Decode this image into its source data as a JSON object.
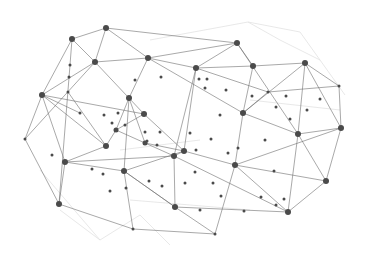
{
  "graphic": {
    "title": "",
    "description": "Abstract network mesh of connected nodes",
    "background": "#ffffff",
    "edge_color": "#6e6e6e",
    "faint_edge_color": "#e2e2e2",
    "node_color": "#4a4a4a",
    "nodes": [
      [
        106,
        28,
        3
      ],
      [
        72,
        39,
        3
      ],
      [
        95,
        62,
        3
      ],
      [
        148,
        58,
        3
      ],
      [
        237,
        43,
        3
      ],
      [
        196,
        68,
        3
      ],
      [
        253,
        66,
        3
      ],
      [
        305,
        63,
        3
      ],
      [
        42,
        95,
        3
      ],
      [
        129,
        98,
        3
      ],
      [
        144,
        114,
        3
      ],
      [
        116,
        130,
        2.5
      ],
      [
        106,
        146,
        3
      ],
      [
        243,
        113,
        3
      ],
      [
        298,
        134,
        3
      ],
      [
        341,
        128,
        3
      ],
      [
        268,
        92,
        1.5
      ],
      [
        339,
        86,
        1.5
      ],
      [
        65,
        162,
        3
      ],
      [
        174,
        156,
        3
      ],
      [
        184,
        151,
        3
      ],
      [
        235,
        165,
        3
      ],
      [
        124,
        171,
        3
      ],
      [
        145,
        143,
        2.5
      ],
      [
        59,
        204,
        3
      ],
      [
        326,
        181,
        3
      ],
      [
        288,
        212,
        3
      ],
      [
        175,
        207,
        3
      ],
      [
        133,
        229,
        1.5
      ],
      [
        215,
        234,
        1.5
      ],
      [
        25,
        139,
        1.5
      ],
      [
        70,
        65,
        1.5
      ],
      [
        69,
        77,
        1.5
      ],
      [
        68,
        92,
        1.5
      ],
      [
        80,
        113,
        1.5
      ],
      [
        135,
        80,
        1.5
      ],
      [
        161,
        77,
        1.5
      ],
      [
        199,
        79,
        1.5
      ],
      [
        207,
        79,
        1.5
      ],
      [
        205,
        88,
        1.5
      ],
      [
        226,
        90,
        1.5
      ],
      [
        252,
        96,
        1.5
      ],
      [
        286,
        96,
        1.5
      ],
      [
        276,
        107,
        1.5
      ],
      [
        307,
        110,
        1.5
      ],
      [
        320,
        99,
        1.5
      ],
      [
        290,
        119,
        1.5
      ],
      [
        112,
        123,
        1.5
      ],
      [
        125,
        125,
        1.5
      ],
      [
        145,
        132,
        1.5
      ],
      [
        160,
        132,
        1.5
      ],
      [
        147,
        141,
        1.5
      ],
      [
        157,
        145,
        1.5
      ],
      [
        190,
        133,
        1.5
      ],
      [
        211,
        139,
        1.5
      ],
      [
        220,
        115,
        1.5
      ],
      [
        228,
        153,
        1.5
      ],
      [
        265,
        140,
        1.5
      ],
      [
        274,
        171,
        1.5
      ],
      [
        196,
        150,
        1.5
      ],
      [
        238,
        148,
        1.5
      ],
      [
        162,
        186,
        1.5
      ],
      [
        185,
        183,
        1.5
      ],
      [
        195,
        172,
        1.5
      ],
      [
        221,
        196,
        1.5
      ],
      [
        213,
        183,
        1.5
      ],
      [
        110,
        191,
        1.5
      ],
      [
        103,
        174,
        1.5
      ],
      [
        126,
        188,
        1.5
      ],
      [
        149,
        181,
        1.5
      ],
      [
        261,
        197,
        1.5
      ],
      [
        276,
        205,
        1.5
      ],
      [
        284,
        199,
        1.5
      ],
      [
        244,
        211,
        1.5
      ],
      [
        200,
        210,
        1.5
      ],
      [
        52,
        155,
        1.5
      ],
      [
        92,
        169,
        1.5
      ],
      [
        118,
        113,
        1.5
      ],
      [
        104,
        115,
        1.5
      ]
    ],
    "edges": [
      [
        0,
        1
      ],
      [
        0,
        2
      ],
      [
        0,
        3
      ],
      [
        0,
        4
      ],
      [
        1,
        2
      ],
      [
        1,
        8
      ],
      [
        1,
        31
      ],
      [
        2,
        8
      ],
      [
        2,
        10
      ],
      [
        2,
        30
      ],
      [
        3,
        5
      ],
      [
        3,
        13
      ],
      [
        3,
        9
      ],
      [
        3,
        2
      ],
      [
        4,
        5
      ],
      [
        4,
        6
      ],
      [
        4,
        14
      ],
      [
        4,
        3
      ],
      [
        5,
        6
      ],
      [
        5,
        19
      ],
      [
        5,
        20
      ],
      [
        6,
        7
      ],
      [
        6,
        13
      ],
      [
        7,
        15
      ],
      [
        7,
        13
      ],
      [
        7,
        14
      ],
      [
        7,
        17
      ],
      [
        8,
        12
      ],
      [
        8,
        10
      ],
      [
        8,
        18
      ],
      [
        9,
        11
      ],
      [
        9,
        22
      ],
      [
        10,
        20
      ],
      [
        10,
        11
      ],
      [
        11,
        12
      ],
      [
        11,
        19
      ],
      [
        12,
        18
      ],
      [
        13,
        14
      ],
      [
        13,
        21
      ],
      [
        14,
        15
      ],
      [
        14,
        25
      ],
      [
        14,
        26
      ],
      [
        15,
        25
      ],
      [
        16,
        13
      ],
      [
        16,
        17
      ],
      [
        17,
        15
      ],
      [
        18,
        22
      ],
      [
        18,
        24
      ],
      [
        19,
        20
      ],
      [
        19,
        27
      ],
      [
        19,
        26
      ],
      [
        20,
        21
      ],
      [
        20,
        22
      ],
      [
        21,
        26
      ],
      [
        21,
        15
      ],
      [
        22,
        27
      ],
      [
        22,
        28
      ],
      [
        23,
        9
      ],
      [
        23,
        20
      ],
      [
        24,
        28
      ],
      [
        25,
        26
      ],
      [
        26,
        27
      ],
      [
        27,
        29
      ],
      [
        28,
        29
      ],
      [
        29,
        21
      ],
      [
        30,
        8
      ],
      [
        30,
        24
      ],
      [
        12,
        33
      ],
      [
        8,
        34
      ],
      [
        22,
        27
      ],
      [
        5,
        16
      ],
      [
        21,
        25
      ],
      [
        18,
        19
      ],
      [
        24,
        31
      ]
    ],
    "faint_edges": [
      [
        248,
        22,
        280,
        40
      ],
      [
        248,
        22,
        300,
        32
      ],
      [
        280,
        40,
        320,
        60
      ],
      [
        300,
        32,
        345,
        95
      ],
      [
        150,
        40,
        248,
        22
      ],
      [
        60,
        210,
        100,
        240
      ],
      [
        100,
        240,
        140,
        215
      ],
      [
        140,
        215,
        170,
        245
      ],
      [
        40,
        170,
        100,
        240
      ],
      [
        120,
        150,
        200,
        140
      ],
      [
        130,
        200,
        250,
        210
      ],
      [
        250,
        100,
        340,
        110
      ]
    ]
  }
}
